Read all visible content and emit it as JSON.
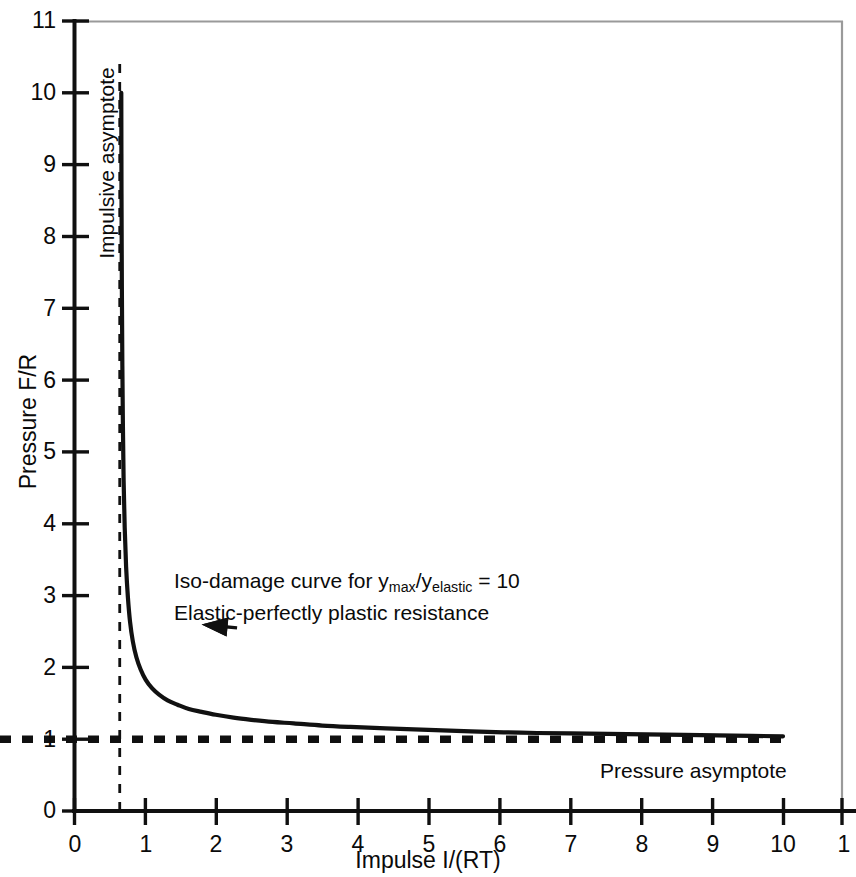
{
  "chart_data": {
    "type": "line",
    "title": "",
    "xlabel": "Impulse I/(RT)",
    "ylabel": "Pressure F/R",
    "xlim": [
      0,
      10.7
    ],
    "ylim": [
      0,
      11
    ],
    "grid": false,
    "legend": "none",
    "xticks": [
      0,
      1,
      2,
      3,
      4,
      5,
      6,
      7,
      8,
      9,
      10,
      11
    ],
    "xticklabels": [
      "0",
      "1",
      "2",
      "3",
      "4",
      "5",
      "6",
      "7",
      "8",
      "9",
      "10",
      "1"
    ],
    "yticks": [
      0,
      1,
      2,
      3,
      4,
      5,
      6,
      7,
      8,
      9,
      10,
      11
    ],
    "yticklabels": [
      "0",
      "1",
      "2",
      "3",
      "4",
      "5",
      "6",
      "7",
      "8",
      "9",
      "10",
      "11"
    ],
    "series": [
      {
        "name": "Iso-damage curve",
        "style": "solid",
        "x": [
          0.667,
          0.67,
          0.675,
          0.682,
          0.69,
          0.7,
          0.715,
          0.735,
          0.76,
          0.79,
          0.83,
          0.88,
          0.94,
          1.01,
          1.1,
          1.2,
          1.32,
          1.46,
          1.62,
          1.8,
          2.0,
          2.25,
          2.5,
          2.8,
          3.1,
          3.5,
          3.9,
          4.4,
          5.0,
          5.6,
          6.3,
          7.0,
          7.8,
          8.6,
          9.3,
          10.0
        ],
        "y": [
          10.0,
          8.6,
          7.3,
          6.2,
          5.35,
          4.6,
          3.95,
          3.4,
          2.98,
          2.64,
          2.36,
          2.14,
          1.97,
          1.83,
          1.71,
          1.62,
          1.54,
          1.48,
          1.42,
          1.38,
          1.34,
          1.3,
          1.27,
          1.24,
          1.22,
          1.19,
          1.17,
          1.15,
          1.13,
          1.11,
          1.09,
          1.08,
          1.07,
          1.06,
          1.05,
          1.04
        ]
      },
      {
        "name": "Impulsive asymptote",
        "style": "dashed",
        "orientation": "vertical",
        "value": 0.645,
        "from": 0,
        "to": 10.45
      },
      {
        "name": "Pressure asymptote",
        "style": "dashed",
        "orientation": "horizontal",
        "value": 1.0,
        "from": 0,
        "to": 10.0
      }
    ],
    "annotations": [
      {
        "name": "iso-damage-label",
        "line1_prefix": "Iso-damage curve for y",
        "line1_sub1": "max",
        "line1_slash": "/y",
        "line1_sub2": "elastic",
        "line1_suffix": " = 10",
        "line2": "Elastic-perfectly plastic resistance",
        "x": 1.45,
        "y": 3.4
      },
      {
        "name": "impulsive-asymptote-label",
        "text": "Impulsive asymptote",
        "x": 0.52,
        "y": 8.6
      },
      {
        "name": "pressure-asymptote-label",
        "text": "Pressure asymptote",
        "x": 7.4,
        "y": 0.72
      },
      {
        "name": "callout-arrow",
        "tail_x": 2.3,
        "tail_y": 2.55,
        "head_x": 1.32,
        "head_y": 1.83
      }
    ]
  },
  "axes": {
    "y_title": "Pressure F/R",
    "x_title": "Impulse I/(RT)"
  },
  "colors": {
    "curve": "#111111",
    "axis": "#101010",
    "frame_light": "#9a9a9a",
    "background": "#ffffff"
  }
}
